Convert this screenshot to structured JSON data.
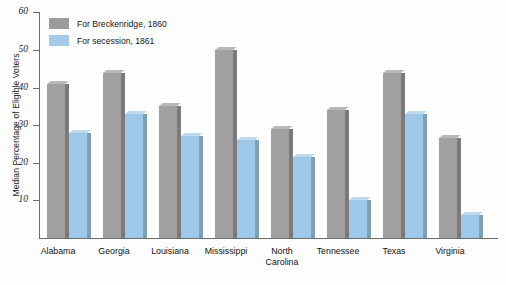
{
  "chart_data": {
    "type": "bar",
    "title": "",
    "xlabel": "",
    "ylabel": "Median Percentage of Eligible Voters",
    "ylim": [
      0,
      60
    ],
    "yticks": [
      10,
      20,
      30,
      40,
      50,
      60
    ],
    "grid": false,
    "legend_position": "top-left",
    "categories": [
      "Alabama",
      "Georgia",
      "Louisiana",
      "Mississippi",
      "North Carolina",
      "Tennessee",
      "Texas",
      "Virginia"
    ],
    "category_lines": [
      [
        "Alabama"
      ],
      [
        "Georgia"
      ],
      [
        "Louisiana"
      ],
      [
        "Mississippi"
      ],
      [
        "North",
        "Carolina"
      ],
      [
        "Tennessee"
      ],
      [
        "Texas"
      ],
      [
        "Virginia"
      ]
    ],
    "series": [
      {
        "name": "For Breckenridge, 1860",
        "color": "#a0a0a0",
        "values": [
          41,
          44,
          35,
          50,
          29,
          34,
          44,
          26.5
        ]
      },
      {
        "name": "For secession, 1861",
        "color": "#9fc8e8",
        "values": [
          28,
          33,
          27,
          26,
          21.5,
          10,
          33,
          6
        ]
      }
    ]
  },
  "legend": {
    "items": [
      {
        "label": "For Breckenridge, 1860",
        "swatch": "gray"
      },
      {
        "label": "For secession, 1861",
        "swatch": "blue"
      }
    ]
  },
  "axis": {
    "y_title": "Median Percentage of Eligible Voters",
    "y_tick_labels": [
      "60",
      "50",
      "40",
      "30",
      "20",
      "10"
    ]
  }
}
